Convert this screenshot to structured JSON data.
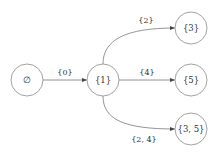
{
  "diagram": {
    "type": "state-transition-graph",
    "nodes": [
      {
        "id": "empty",
        "label": "∅"
      },
      {
        "id": "s1",
        "label": "{1}"
      },
      {
        "id": "s3",
        "label": "{3}"
      },
      {
        "id": "s5",
        "label": "{5}"
      },
      {
        "id": "s35",
        "label": "{3, 5}"
      }
    ],
    "edges": [
      {
        "from": "empty",
        "to": "s1",
        "label": "{0}"
      },
      {
        "from": "s1",
        "to": "s3",
        "label": "{2}"
      },
      {
        "from": "s1",
        "to": "s5",
        "label": "{4}"
      },
      {
        "from": "s1",
        "to": "s35",
        "label": "{2, 4}"
      }
    ]
  }
}
